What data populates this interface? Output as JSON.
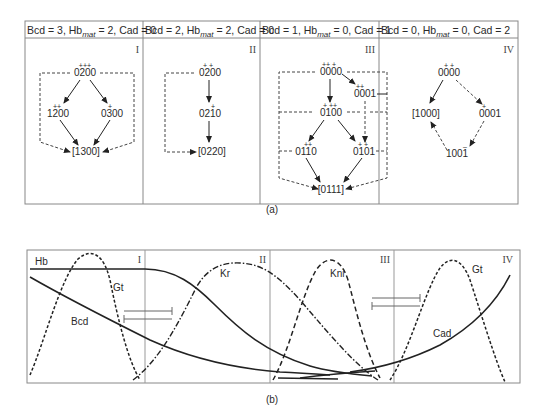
{
  "panel_a": {
    "caption": "(a)",
    "columns": [
      {
        "header": {
          "pre": "Bcd = 3, Hb",
          "sub": "mat",
          "post": " = 2, Cad = 0"
        },
        "roman": "I",
        "nodes": [
          {
            "id": "0200",
            "label": "0200",
            "marks": "+++"
          },
          {
            "id": "1200",
            "label": "1200",
            "marks": "++"
          },
          {
            "id": "0300",
            "label": "0300",
            "marks": "+"
          },
          {
            "id": "1300",
            "label": "[1300]",
            "marks": ""
          }
        ]
      },
      {
        "header": {
          "pre": "Bcd = 2, Hb",
          "sub": "mat",
          "post": " = 2, Cad = 0"
        },
        "roman": "II",
        "nodes": [
          {
            "id": "0200",
            "label": "0200",
            "marks": "+  +"
          },
          {
            "id": "0210",
            "label": "0210",
            "marks": "+"
          },
          {
            "id": "0220",
            "label": "[0220]",
            "marks": ""
          }
        ]
      },
      {
        "header": {
          "pre": "Bcd = 1, Hb",
          "sub": "mat",
          "post": " = 0, Cad = 1"
        },
        "roman": "III",
        "nodes": [
          {
            "id": "0000",
            "label": "0000",
            "marks": "++  +"
          },
          {
            "id": "0001",
            "label": "0001",
            "marks": "++"
          },
          {
            "id": "0100",
            "label": "0100",
            "marks": "+  ++"
          },
          {
            "id": "0110",
            "label": "0110",
            "marks": "++"
          },
          {
            "id": "0101",
            "label": "0101",
            "marks": "+  +"
          },
          {
            "id": "0111",
            "label": "[0111]",
            "marks": ""
          }
        ]
      },
      {
        "header": {
          "pre": "Bcd = 0, Hb",
          "sub": "mat",
          "post": " = 0, Cad = 2"
        },
        "roman": "IV",
        "nodes": [
          {
            "id": "0000",
            "label": "0000",
            "marks": "+    +"
          },
          {
            "id": "1000",
            "label": "[1000]",
            "marks": ""
          },
          {
            "id": "0001",
            "label": "0001",
            "marks": "+"
          },
          {
            "id": "1001",
            "label": "1001",
            "marks": "–"
          }
        ]
      }
    ]
  },
  "panel_b": {
    "caption": "(b)",
    "regions": [
      "I",
      "II",
      "III",
      "IV"
    ],
    "curve_labels": {
      "hb": "Hb",
      "gt_left": "Gt",
      "bcd": "Bcd",
      "kr": "Kr",
      "kni": "Kni",
      "gt_right": "Gt",
      "cad": "Cad"
    }
  },
  "colors": {
    "line": "#222222",
    "frame": "#888888",
    "text": "#2a2a2a"
  }
}
